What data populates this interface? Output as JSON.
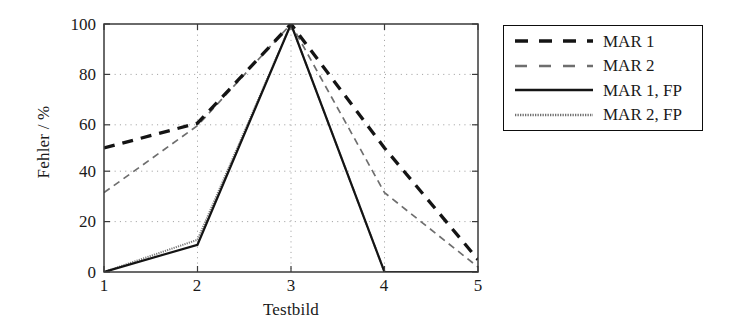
{
  "chart_data": {
    "type": "line",
    "title": "",
    "xlabel": "Testbild",
    "ylabel": "Fehler / %",
    "x": [
      1,
      2,
      3,
      4,
      5
    ],
    "xticklabels": [
      "1",
      "2",
      "3",
      "4",
      "5"
    ],
    "yticklabels": [
      "0",
      "20",
      "40",
      "60",
      "80",
      "100"
    ],
    "yticks": [
      0,
      20,
      40,
      60,
      80,
      100
    ],
    "xlim": [
      1,
      5
    ],
    "ylim": [
      0,
      100
    ],
    "grid": true,
    "grid_style": "dotted",
    "legend_position": "outside right top",
    "series": [
      {
        "name": "MAR 1",
        "values": [
          50,
          60,
          100,
          50,
          5
        ],
        "style": "dashed",
        "color": "#141414",
        "width": 3.2
      },
      {
        "name": "MAR 2",
        "values": [
          32,
          59,
          100,
          32,
          2
        ],
        "style": "dashed",
        "color": "#6e6e6e",
        "width": 1.6
      },
      {
        "name": "MAR 1, FP",
        "values": [
          0,
          11,
          100,
          0,
          0
        ],
        "style": "solid",
        "color": "#141414",
        "width": 2.2
      },
      {
        "name": "MAR 2, FP",
        "values": [
          0,
          13,
          100,
          0,
          0
        ],
        "style": "solid",
        "color": "#767676",
        "width": 1.5
      }
    ]
  },
  "axes": {
    "y_title": "Fehler / %",
    "x_title": "Testbild",
    "y_ticks": [
      "100",
      "80",
      "60",
      "40",
      "20",
      "0"
    ],
    "x_ticks": [
      "1",
      "2",
      "3",
      "4",
      "5"
    ]
  },
  "legend": {
    "items": [
      {
        "label": "MAR 1"
      },
      {
        "label": "MAR 2"
      },
      {
        "label": "MAR 1, FP"
      },
      {
        "label": "MAR 2, FP"
      }
    ]
  }
}
